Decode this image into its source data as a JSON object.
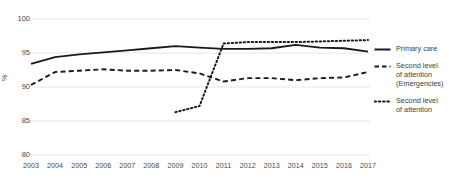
{
  "chart_data": {
    "type": "line",
    "title": "",
    "xlabel": "",
    "ylabel": "%",
    "ylim": [
      80,
      100
    ],
    "yticks": [
      80,
      85,
      90,
      95,
      100
    ],
    "grid": true,
    "legend_position": "right",
    "x": [
      2003,
      2004,
      2005,
      2006,
      2007,
      2008,
      2009,
      2010,
      2011,
      2012,
      2013,
      2014,
      2015,
      2016,
      2017
    ],
    "categories": [
      "2003",
      "2004",
      "2005",
      "2006",
      "2007",
      "2008",
      "2009",
      "2010",
      "2011",
      "2012",
      "2013",
      "2014",
      "2015",
      "2016",
      "2017"
    ],
    "series": [
      {
        "name": "Primary care",
        "style": "solid",
        "color": "#1a1a1a",
        "values": [
          93.4,
          94.4,
          94.8,
          95.1,
          95.4,
          95.7,
          96.0,
          95.8,
          95.6,
          95.6,
          95.7,
          96.2,
          95.8,
          95.7,
          95.2
        ]
      },
      {
        "name": "Second level of attention (Emergencies)",
        "style": "dashed",
        "color": "#1a1a1a",
        "values": [
          90.3,
          92.2,
          92.4,
          92.6,
          92.4,
          92.4,
          92.5,
          92.0,
          90.8,
          91.3,
          91.3,
          91.0,
          91.3,
          91.4,
          92.2
        ]
      },
      {
        "name": "Second level of attention",
        "style": "dotted",
        "color": "#1a1a1a",
        "values": [
          null,
          null,
          null,
          null,
          null,
          null,
          86.3,
          87.2,
          96.4,
          96.6,
          96.6,
          96.6,
          96.7,
          96.8,
          96.9
        ]
      }
    ]
  },
  "axes": {
    "y_label": "%",
    "y_ticks": [
      "100",
      "95",
      "90",
      "85",
      "80"
    ],
    "x_ticks": [
      "2003",
      "2004",
      "2005",
      "2006",
      "2007",
      "2008",
      "2009",
      "2010",
      "2011",
      "2012",
      "2013",
      "2014",
      "2015",
      "2016",
      "2017"
    ]
  },
  "legend": {
    "items": [
      {
        "icon": "solid-line-icon",
        "lines": [
          "Primary care"
        ]
      },
      {
        "icon": "dashed-line-icon",
        "lines": [
          "Second level",
          "of attention",
          "(Emergencies)"
        ]
      },
      {
        "icon": "dotted-line-icon",
        "lines": [
          "Second level",
          "of attention"
        ]
      }
    ]
  },
  "colors": {
    "line": "#1a1a1a",
    "grid": "#e2e2e2",
    "text": "#3d3d3d"
  }
}
